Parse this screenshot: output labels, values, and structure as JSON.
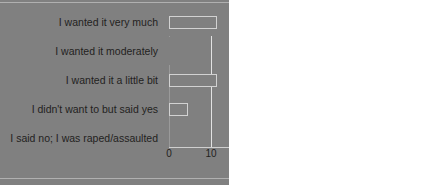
{
  "chart_data": {
    "type": "bar",
    "orientation": "horizontal",
    "title": "",
    "xlabel": "",
    "ylabel": "",
    "categories": [
      "I wanted it very much",
      "I wanted it moderately",
      "I wanted it a little bit",
      "I didn't want to but said yes",
      "I said no; I was raped/assaulted"
    ],
    "values": [
      54.5,
      27,
      11,
      4,
      0
    ],
    "xlim": [
      0,
      60
    ],
    "xticks": [
      0,
      10,
      20,
      30,
      40,
      50,
      60
    ],
    "xtick_labels": [
      "0",
      "10",
      "20",
      "30",
      "40",
      "50",
      "60"
    ],
    "grid": true,
    "legend": false,
    "bar_color": "#808080",
    "bar_edge_color": "#d2d2d2",
    "gridline_color": "#e2e2e2",
    "axis_color": "#9a9a9a",
    "text_color": "#231f20",
    "background": "#ffffff"
  }
}
